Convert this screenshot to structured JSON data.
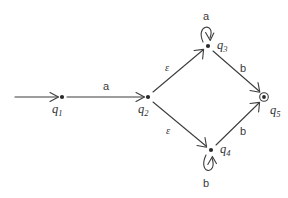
{
  "diagram": {
    "kind": "nfa-state-diagram",
    "colors": {
      "background": "#ffffff",
      "stroke": "#3d3d3d",
      "state_fill": "#2a2a2a",
      "text": "#333333"
    },
    "states": [
      {
        "id": "q1",
        "label": "q",
        "subscript": "1",
        "x": 62,
        "y": 97,
        "accepting": false,
        "start": true,
        "label_dx": -5,
        "label_dy": 12
      },
      {
        "id": "q2",
        "label": "q",
        "subscript": "2",
        "x": 148,
        "y": 97,
        "accepting": false,
        "start": false,
        "label_dx": -5,
        "label_dy": 12
      },
      {
        "id": "q3",
        "label": "q",
        "subscript": "3",
        "x": 208,
        "y": 46,
        "accepting": false,
        "start": false,
        "label_dx": 9,
        "label_dy": 1
      },
      {
        "id": "q4",
        "label": "q",
        "subscript": "4",
        "x": 211,
        "y": 150,
        "accepting": false,
        "start": false,
        "label_dx": 9,
        "label_dy": 1
      },
      {
        "id": "q5",
        "label": "q",
        "subscript": "5",
        "x": 264,
        "y": 97,
        "accepting": true,
        "start": false,
        "label_dx": 6,
        "label_dy": 13
      }
    ],
    "start_arrow": {
      "from_x": 15,
      "to_x": 58,
      "y": 97
    },
    "transitions": [
      {
        "from": "q1",
        "to": "q2",
        "symbol": "a",
        "label_x": 103,
        "label_y": 81,
        "kind": "straight"
      },
      {
        "from": "q2",
        "to": "q3",
        "symbol": "ε",
        "label_x": 165,
        "label_y": 63,
        "kind": "straight"
      },
      {
        "from": "q2",
        "to": "q4",
        "symbol": "ε",
        "label_x": 166,
        "label_y": 126,
        "kind": "straight"
      },
      {
        "from": "q3",
        "to": "q5",
        "symbol": "b",
        "label_x": 240,
        "label_y": 63,
        "kind": "straight"
      },
      {
        "from": "q4",
        "to": "q5",
        "symbol": "b",
        "label_x": 240,
        "label_y": 126,
        "kind": "straight"
      },
      {
        "from": "q3",
        "to": "q3",
        "symbol": "a",
        "label_x": 203,
        "label_y": 11,
        "kind": "self-loop-up"
      },
      {
        "from": "q4",
        "to": "q4",
        "symbol": "b",
        "label_x": 203,
        "label_y": 178,
        "kind": "self-loop-down"
      }
    ],
    "alphabet": [
      "a",
      "b",
      "ε"
    ],
    "start_state": "q1",
    "accepting_states": [
      "q5"
    ]
  }
}
